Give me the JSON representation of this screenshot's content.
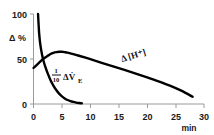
{
  "chart_data": {
    "type": "line",
    "title": "",
    "subtitle": "",
    "xlabel": "min",
    "ylabel": "Δ %",
    "xlim": [
      0,
      30
    ],
    "ylim": [
      0,
      100
    ],
    "xticks": [
      "0",
      "5",
      "10",
      "15",
      "20",
      "25",
      "30"
    ],
    "xtick_values": [
      0,
      5,
      10,
      15,
      20,
      25,
      30
    ],
    "yticks": [
      "0",
      "50",
      "100"
    ],
    "ytick_values": [
      0,
      50,
      100
    ],
    "grid": false,
    "legend_position": "inline-annotations",
    "series": [
      {
        "name": "Δ [H⁺]",
        "label_text": "Δ [H⁺]",
        "x": [
          0.0,
          0.5,
          1.0,
          1.5,
          2.0,
          2.5,
          3.0,
          3.5,
          4.0,
          4.5,
          5.0,
          5.5,
          6.0,
          7.0,
          8.0,
          10.0,
          12.0,
          14.0,
          16.0,
          18.0,
          20.0,
          22.0,
          24.0,
          26.0,
          28.0
        ],
        "values": [
          40,
          43,
          46,
          49,
          51.5,
          53.5,
          55.5,
          56.8,
          57.6,
          58.0,
          58.0,
          57.6,
          57.0,
          55.4,
          53.6,
          49.8,
          45.8,
          41.8,
          37.8,
          33.8,
          29.6,
          25.2,
          20.4,
          14.8,
          8.0
        ]
      },
      {
        "name": "1/10 ΔV̇E",
        "label_text": "ΔV̇",
        "label_numerator": "1",
        "label_denominator": "10",
        "label_subscript": "E",
        "x": [
          0.8,
          0.9,
          1.0,
          1.2,
          1.5,
          1.8,
          2.1,
          2.5,
          3.0,
          3.5,
          4.0,
          4.5,
          5.0,
          5.5,
          6.0,
          6.5,
          7.0,
          7.5,
          8.0,
          8.5
        ],
        "values": [
          100,
          88,
          78,
          66,
          55,
          47,
          41,
          34,
          26.5,
          20.5,
          15.5,
          11.5,
          8.5,
          6.2,
          4.4,
          3.2,
          2.3,
          1.6,
          1.1,
          0.8
        ]
      }
    ],
    "annotations": [
      {
        "id": "h-plus-label",
        "text": "Δ [H⁺]",
        "x": 17.5,
        "y": 47
      },
      {
        "id": "ve-label",
        "text": "1/10 ΔV̇E",
        "x": 6.3,
        "y": 35
      }
    ],
    "colors": {
      "curve": "#000000",
      "axis": "#9a9a9a",
      "text": "#1a1a1a",
      "background": "#ffffff"
    }
  }
}
